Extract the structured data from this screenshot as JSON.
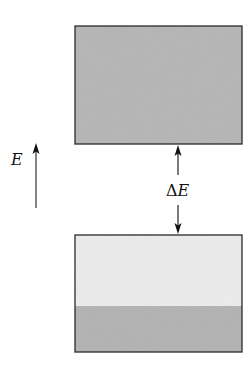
{
  "diagram": {
    "type": "energy-band-diagram",
    "axis_label": "E",
    "gap_label_delta": "Δ",
    "gap_label_var": "E",
    "bands": [
      {
        "name": "upper-band",
        "fill": "#b8b8b8",
        "filled_fraction": 1.0
      },
      {
        "name": "lower-band",
        "fill_empty": "#ececec",
        "fill_filled": "#b5b5b5",
        "filled_fraction": 0.4
      }
    ],
    "colors": {
      "stroke": "#222222",
      "band_fill": "#b8b8b8",
      "band_empty": "#ececec"
    }
  }
}
